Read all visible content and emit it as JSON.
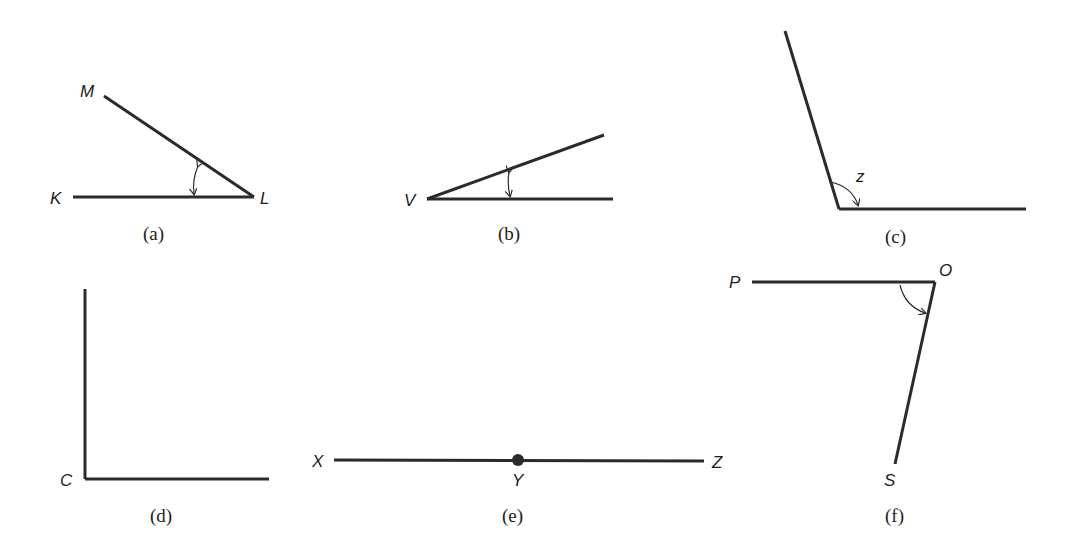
{
  "figures": {
    "a": {
      "caption": "(a)",
      "points": {
        "M": "M",
        "K": "K",
        "L": "L"
      }
    },
    "b": {
      "caption": "(b)",
      "points": {
        "V": "V"
      }
    },
    "c": {
      "caption": "(c)",
      "angle_label": "z"
    },
    "d": {
      "caption": "(d)",
      "points": {
        "C": "C"
      }
    },
    "e": {
      "caption": "(e)",
      "points": {
        "X": "X",
        "Y": "Y",
        "Z": "Z"
      }
    },
    "f": {
      "caption": "(f)",
      "points": {
        "P": "P",
        "O": "O",
        "S": "S"
      }
    }
  },
  "colors": {
    "line": "#2b2b2b",
    "text": "#1e1e1e",
    "background": "#ffffff"
  }
}
